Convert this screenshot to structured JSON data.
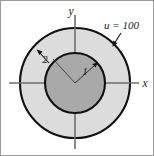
{
  "figure": {
    "name": "annulus-boundary-value-figure",
    "background_color": "#ffffff",
    "frame_border_color": "#9a9a9a",
    "axes": {
      "x_label": "x",
      "y_label": "y",
      "axis_color": "#6e6e6e",
      "origin": {
        "x": 74,
        "y": 82
      }
    },
    "regions": {
      "outer_annulus": {
        "label": "outer-annulus",
        "fill_color": "#dcdcdc",
        "stroke_color": "#101010",
        "radius_px": 55,
        "radius_value": "2"
      },
      "inner_disk": {
        "label": "inner-disk",
        "fill_color": "#a9a9a9",
        "stroke_color": "#101010",
        "radius_px": 30,
        "radius_value": "1"
      }
    },
    "annotations": {
      "boundary_condition": "u = 100",
      "outer_radius_label": "2",
      "inner_radius_label": "1"
    }
  }
}
